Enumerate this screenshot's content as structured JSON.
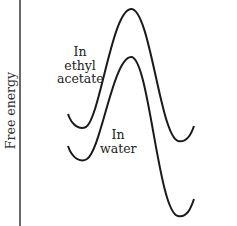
{
  "diagram": {
    "type": "energy-profile",
    "y_axis_label": "Free energy",
    "curves": [
      {
        "name": "ethyl-acetate",
        "label_lines": [
          "In",
          "ethyl",
          "acetate"
        ],
        "path": "M68,114 C72,126 80,130 86,127 C100,118 112,10 131,9 C150,8 160,135 178,141 C186,143 191,135 194,126",
        "color": "#1a1a1a"
      },
      {
        "name": "water",
        "label_lines": [
          "In",
          "water"
        ],
        "path": "M68,146 C72,158 80,163 87,159 C101,150 113,58 131,57 C149,56 158,212 178,216 C187,218 191,208 194,199",
        "color": "#1a1a1a"
      }
    ]
  }
}
